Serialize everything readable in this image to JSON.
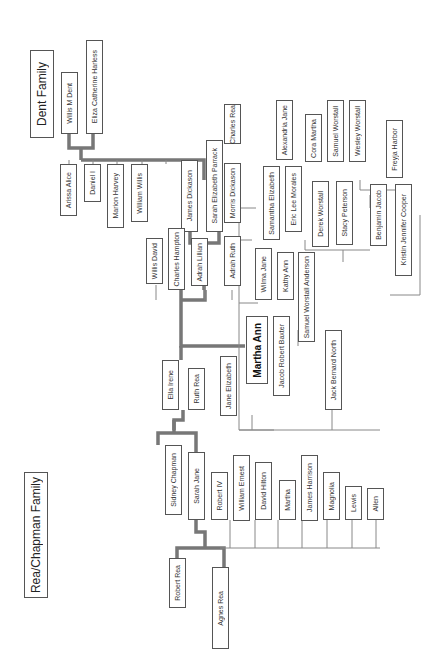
{
  "titles": {
    "dent": "Dent Family",
    "rea_chapman": "Rea/Chapman Family"
  },
  "people": {
    "willis_m_dent": "Willis M Dent",
    "eliza_catherine_harless": "Eliza Catherine Harless",
    "arissa_alice": "Arissa Alice",
    "daniel_i": "Daniel I",
    "marion_harvey": "Marion Harvey",
    "william_willis": "William Willis",
    "james_dickason": "James Dickason",
    "sarah_elizabeth_parrack": "Sarah Elizabeth Parrack",
    "willis_david": "Willis David",
    "charles_hampton": "Charles Hampton",
    "adrah_lillian": "Adrah Lillian",
    "charles_rea": "Charles Rea",
    "morris_dickason": "Morris Dickason",
    "adrah_ruth": "Adrah Ruth",
    "alexandria_jane": "Alexandria Jane",
    "samantha_elizabeth": "Samantha Elizabeth",
    "eric_lee_morales": "Eric Lee Morales",
    "cora_martha": "Cora Martha",
    "samuel_worstall": "Samuel Worstall",
    "wesley_worstall": "Wesley Worstall",
    "derek_worstall": "Derek Worstall",
    "stacy_peterson": "Stacy Peterson",
    "freyja_harbor": "Freyja Harbor",
    "benjamin_jacob": "Benjamin Jacob",
    "kristin_jennifer_cooper": "Kristin Jennifer Cooper",
    "wilma_jane": "Wilma Jane",
    "kathy_ann": "Kathy Ann",
    "samuel_worstall_anderson": "Samuel Worstall Anderson",
    "martha_ann": "Martha Ann",
    "jacob_robert_baxter": "Jacob Robert Baxter",
    "jack_bernard_north": "Jack Bernard North",
    "ella_irene": "Ella Irene",
    "ruth_rea": "Ruth Rea",
    "jane_elizabeth": "Jane Elizabeth",
    "sidney_chapman": "Sidney Chapman",
    "sarah_jane": "Sarah Jane",
    "robert_iv": "Robert IV",
    "william_ernest": "William Ernest",
    "david_hilton": "David Hilton",
    "martha": "Martha",
    "james_harrison": "James Harrison",
    "magnolia": "Magnolia",
    "lewis": "Lewis",
    "allen": "Allen",
    "robert_rea": "Robert Rea",
    "agnes_rea": "Agnes Rea"
  }
}
